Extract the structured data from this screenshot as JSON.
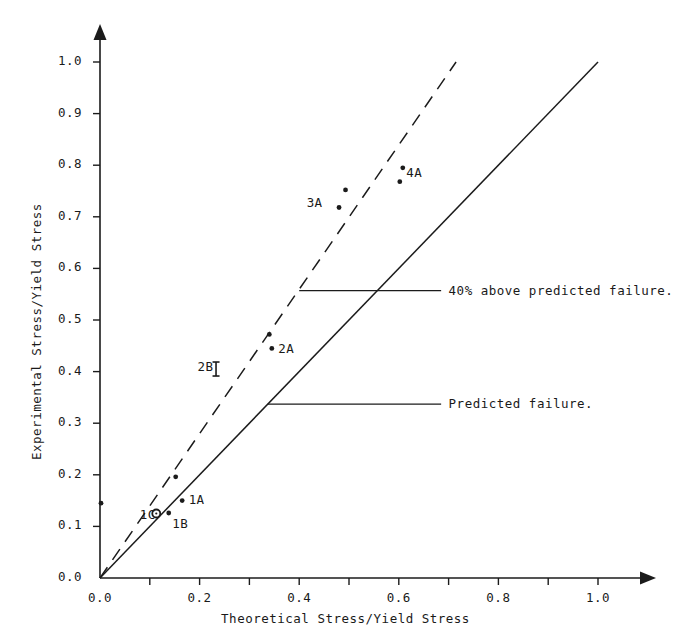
{
  "header": {
    "cropped_top_text": "clipped running head"
  },
  "chart_data": {
    "type": "scatter",
    "title": "",
    "xlabel": "Theoretical Stress/Yield Stress",
    "ylabel": "Experimental Stress/Yield Stress",
    "xlim": [
      0.0,
      1.05
    ],
    "ylim": [
      0.0,
      1.03
    ],
    "grid": false,
    "legend": "none",
    "xticks_major": [
      "0.0",
      "0.2",
      "0.4",
      "0.6",
      "0.8",
      "1.0"
    ],
    "xticks_major_values": [
      0.0,
      0.2,
      0.4,
      0.6,
      0.8,
      1.0
    ],
    "xticks_minor_values": [
      0.1,
      0.3,
      0.5,
      0.7,
      0.9
    ],
    "yticks": [
      "0.0",
      "0.1",
      "0.2",
      "0.3",
      "0.4",
      "0.5",
      "0.6",
      "0.7",
      "0.8",
      "0.9",
      "1.0"
    ],
    "yticks_values": [
      0.0,
      0.1,
      0.2,
      0.3,
      0.4,
      0.5,
      0.6,
      0.7,
      0.8,
      0.9,
      1.0
    ],
    "reference_lines": [
      {
        "name": "predicted-failure-line",
        "style": "solid",
        "label": "Predicted failure.",
        "slope": 1.0,
        "x0": 0.0,
        "y0": 0.0,
        "x1": 1.0,
        "y1": 1.0
      },
      {
        "name": "forty-percent-above-line",
        "style": "dashed",
        "label": "40% above predicted failure.",
        "slope": 1.4,
        "x0": 0.0,
        "y0": 0.0,
        "x1": 0.715,
        "y1": 1.0
      }
    ],
    "annotations": [
      {
        "name": "annotation-40-percent",
        "text": "40% above predicted failure.",
        "leader_from": {
          "x": 0.4,
          "y": 0.557
        },
        "leader_to": {
          "x": 0.685,
          "y": 0.557
        },
        "text_x": 0.7,
        "text_y": 0.557
      },
      {
        "name": "annotation-predicted",
        "text": "Predicted failure.",
        "leader_from": {
          "x": 0.337,
          "y": 0.337
        },
        "leader_to": {
          "x": 0.685,
          "y": 0.337
        },
        "text_x": 0.7,
        "text_y": 0.337
      }
    ],
    "points": [
      {
        "label": "",
        "x": 0.002,
        "y": 0.145,
        "marker": "dot"
      },
      {
        "label": "1C",
        "x": 0.113,
        "y": 0.125,
        "marker": "circle"
      },
      {
        "label": "1B",
        "x": 0.138,
        "y": 0.126,
        "marker": "dot"
      },
      {
        "label": "1A",
        "x": 0.165,
        "y": 0.15,
        "marker": "dot"
      },
      {
        "label": "",
        "x": 0.152,
        "y": 0.196,
        "marker": "dot"
      },
      {
        "label": "2B",
        "x": 0.233,
        "y": 0.405,
        "marker": "errorbar"
      },
      {
        "label": "2A",
        "x": 0.345,
        "y": 0.445,
        "marker": "dot"
      },
      {
        "label": "",
        "x": 0.34,
        "y": 0.472,
        "marker": "dot"
      },
      {
        "label": "3A",
        "x": 0.48,
        "y": 0.718,
        "marker": "dot"
      },
      {
        "label": "",
        "x": 0.493,
        "y": 0.752,
        "marker": "dot"
      },
      {
        "label": "4A",
        "x": 0.602,
        "y": 0.768,
        "marker": "dot"
      },
      {
        "label": "",
        "x": 0.608,
        "y": 0.795,
        "marker": "dot"
      }
    ],
    "point_labels": [
      {
        "name": "point-label-1c",
        "text": "1C",
        "x": 0.08,
        "y": 0.122
      },
      {
        "name": "point-label-1b",
        "text": "1B",
        "x": 0.145,
        "y": 0.104
      },
      {
        "name": "point-label-1a",
        "text": "1A",
        "x": 0.178,
        "y": 0.152
      },
      {
        "name": "point-label-2b",
        "text": "2B",
        "x": 0.196,
        "y": 0.409
      },
      {
        "name": "point-label-2a",
        "text": "2A",
        "x": 0.358,
        "y": 0.443
      },
      {
        "name": "point-label-3a",
        "text": "3A",
        "x": 0.415,
        "y": 0.727
      },
      {
        "name": "point-label-4a",
        "text": "4A",
        "x": 0.615,
        "y": 0.785
      }
    ]
  }
}
